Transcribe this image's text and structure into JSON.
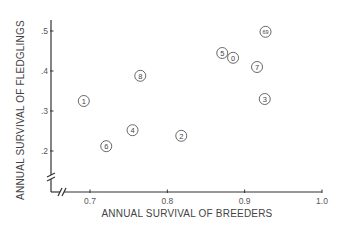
{
  "chart_data": {
    "type": "scatter",
    "title": "",
    "xlabel": "ANNUAL SURVIVAL OF BREEDERS",
    "ylabel": "ANNUAL SURVIVAL OF FLEDGLINGS",
    "xlim": [
      0.65,
      1.0
    ],
    "ylim": [
      0.1,
      0.53
    ],
    "x_ticks": [
      0.7,
      0.8,
      0.9,
      1.0
    ],
    "x_tick_labels": [
      "0.7",
      "0.8",
      "0.9",
      "1.0"
    ],
    "y_ticks": [
      0.2,
      0.3,
      0.4,
      0.5
    ],
    "y_tick_labels": [
      ".2",
      ".3",
      ".4",
      ".5"
    ],
    "axis_breaks": true,
    "grid": false,
    "legend": null,
    "marker": "circled-number",
    "points": [
      {
        "label": "1",
        "x": 0.692,
        "y": 0.325
      },
      {
        "label": "2",
        "x": 0.818,
        "y": 0.238
      },
      {
        "label": "3",
        "x": 0.926,
        "y": 0.33
      },
      {
        "label": "4",
        "x": 0.755,
        "y": 0.252
      },
      {
        "label": "5",
        "x": 0.871,
        "y": 0.445
      },
      {
        "label": "6",
        "x": 0.721,
        "y": 0.212
      },
      {
        "label": "7",
        "x": 0.916,
        "y": 0.41
      },
      {
        "label": "8",
        "x": 0.765,
        "y": 0.388
      },
      {
        "label": "0",
        "x": 0.885,
        "y": 0.433
      },
      {
        "label": "6,9",
        "x": 0.927,
        "y": 0.498
      }
    ]
  }
}
